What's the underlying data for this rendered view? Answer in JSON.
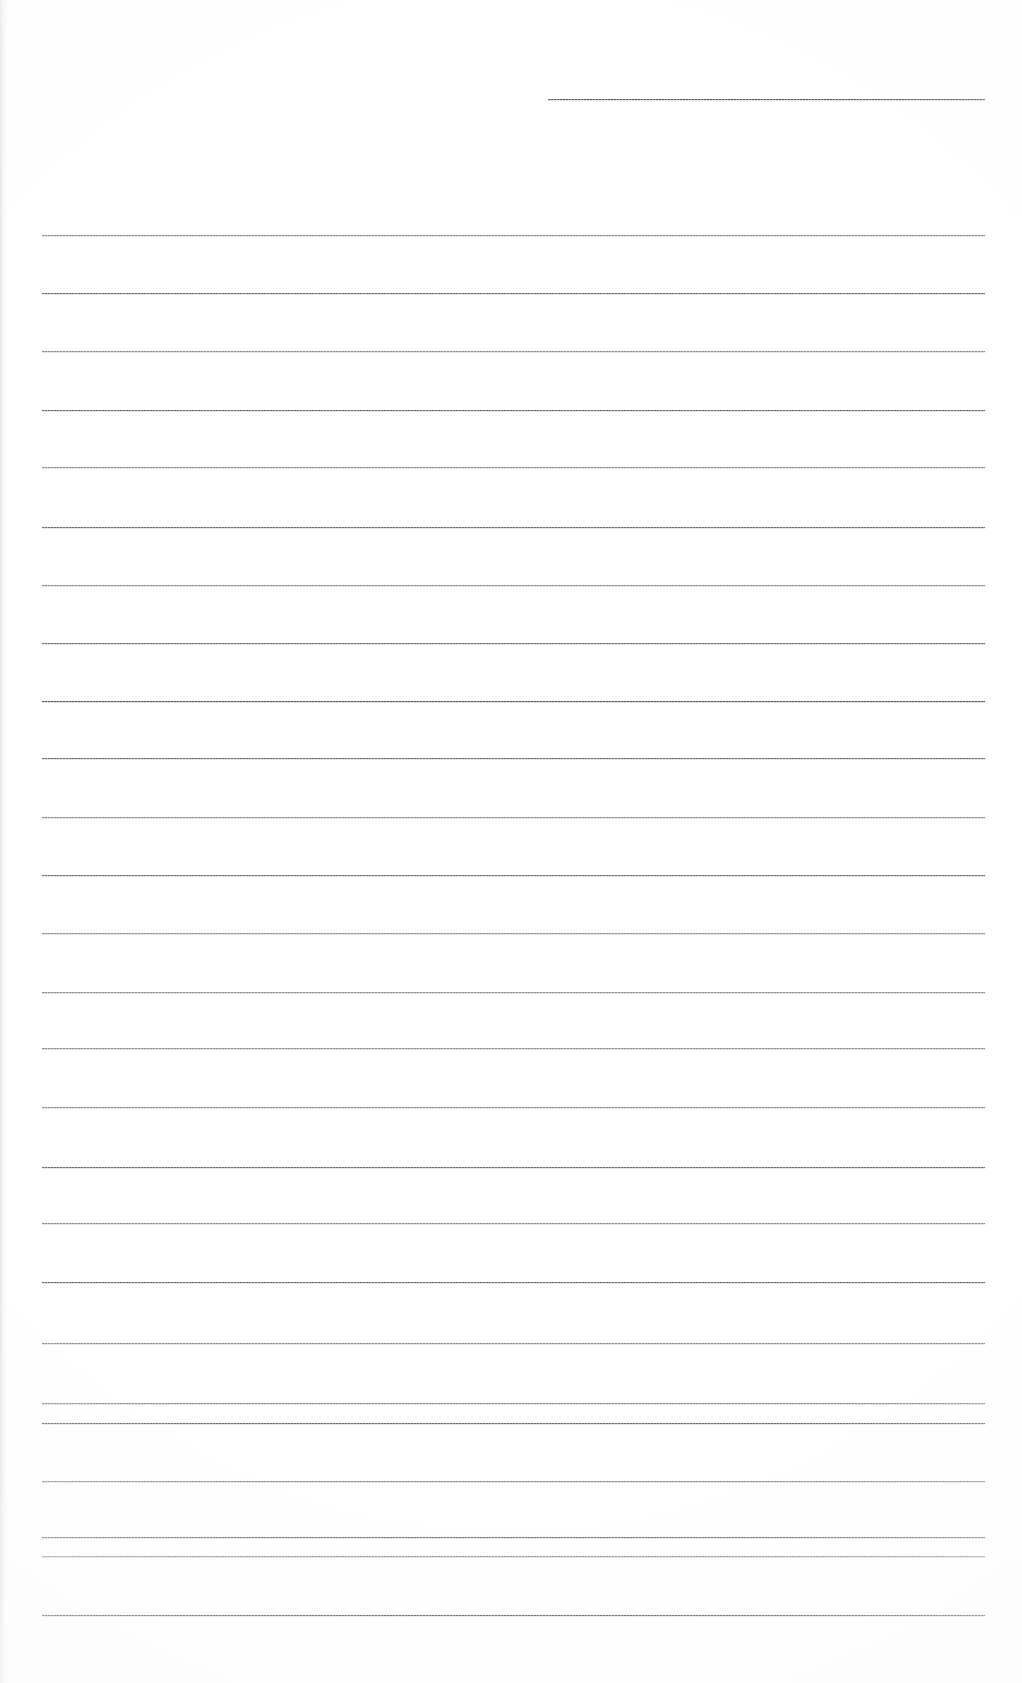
{
  "document": {
    "kind": "scanned-ruled-paper",
    "title": "",
    "visible_text": "",
    "page_width": 1022,
    "page_height": 1683,
    "background_color": "#ffffff",
    "rule_color": "#6e6e72",
    "rule_thickness_px": 1,
    "notes": "Blank scanned sheet of ruled writing paper. No text, headings, numbers, icons or controls are visible anywhere on the page."
  },
  "header_rule": {
    "name": "header-line",
    "x_start": 548,
    "x_end": 985,
    "y": 99,
    "width": 437,
    "tone": "dark"
  },
  "body_rules": [
    {
      "y": 235,
      "x_start": 42,
      "x_end": 985,
      "tone": "faint"
    },
    {
      "y": 293,
      "x_start": 42,
      "x_end": 985,
      "tone": "normal"
    },
    {
      "y": 351,
      "x_start": 42,
      "x_end": 985,
      "tone": "faint"
    },
    {
      "y": 410,
      "x_start": 42,
      "x_end": 985,
      "tone": "normal"
    },
    {
      "y": 467,
      "x_start": 42,
      "x_end": 985,
      "tone": "faint"
    },
    {
      "y": 527,
      "x_start": 42,
      "x_end": 985,
      "tone": "normal"
    },
    {
      "y": 585,
      "x_start": 42,
      "x_end": 985,
      "tone": "faint"
    },
    {
      "y": 643,
      "x_start": 42,
      "x_end": 985,
      "tone": "normal"
    },
    {
      "y": 701,
      "x_start": 42,
      "x_end": 985,
      "tone": "dark"
    },
    {
      "y": 758,
      "x_start": 42,
      "x_end": 985,
      "tone": "normal"
    },
    {
      "y": 817,
      "x_start": 42,
      "x_end": 985,
      "tone": "faint"
    },
    {
      "y": 875,
      "x_start": 42,
      "x_end": 985,
      "tone": "normal"
    },
    {
      "y": 933,
      "x_start": 42,
      "x_end": 985,
      "tone": "faint"
    },
    {
      "y": 992,
      "x_start": 42,
      "x_end": 985,
      "tone": "faint"
    },
    {
      "y": 1048,
      "x_start": 42,
      "x_end": 985,
      "tone": "faint"
    },
    {
      "y": 1107,
      "x_start": 42,
      "x_end": 985,
      "tone": "faint"
    },
    {
      "y": 1167,
      "x_start": 42,
      "x_end": 985,
      "tone": "normal"
    },
    {
      "y": 1223,
      "x_start": 42,
      "x_end": 985,
      "tone": "faint"
    },
    {
      "y": 1282,
      "x_start": 42,
      "x_end": 985,
      "tone": "normal"
    },
    {
      "y": 1343,
      "x_start": 42,
      "x_end": 985,
      "tone": "faint"
    },
    {
      "y": 1403,
      "x_start": 42,
      "x_end": 985,
      "tone": "faint"
    },
    {
      "y": 1423,
      "x_start": 42,
      "x_end": 985,
      "tone": "normal"
    },
    {
      "y": 1481,
      "x_start": 42,
      "x_end": 985,
      "tone": "faint"
    },
    {
      "y": 1537,
      "x_start": 42,
      "x_end": 985,
      "tone": "normal"
    },
    {
      "y": 1556,
      "x_start": 42,
      "x_end": 985,
      "tone": "faint"
    },
    {
      "y": 1615,
      "x_start": 42,
      "x_end": 985,
      "tone": "dark"
    }
  ]
}
